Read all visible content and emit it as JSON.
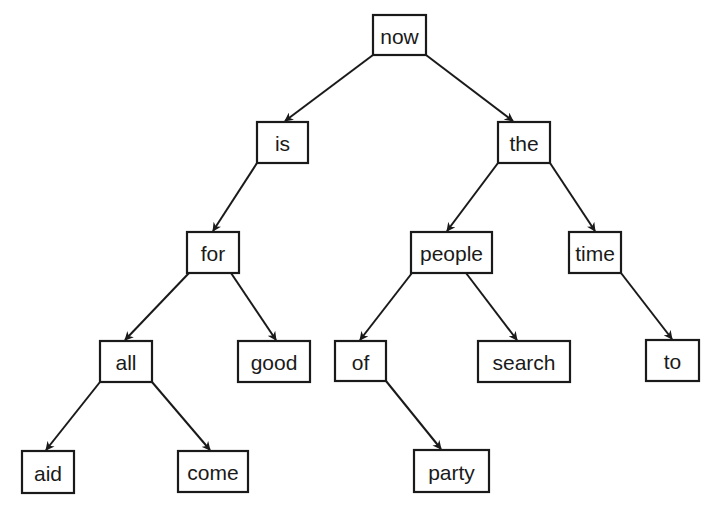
{
  "diagram": {
    "type": "binary-search-tree",
    "colors": {
      "stroke": "#1a1a1a",
      "background": "#ffffff",
      "node_fill": "#ffffff"
    },
    "nodes": [
      {
        "id": "now",
        "label": "now",
        "x": 373,
        "y": 15,
        "w": 53,
        "h": 40
      },
      {
        "id": "is",
        "label": "is",
        "x": 257,
        "y": 122,
        "w": 51,
        "h": 41
      },
      {
        "id": "the",
        "label": "the",
        "x": 498,
        "y": 122,
        "w": 52,
        "h": 41
      },
      {
        "id": "for",
        "label": "for",
        "x": 187,
        "y": 232,
        "w": 52,
        "h": 41
      },
      {
        "id": "people",
        "label": "people",
        "x": 411,
        "y": 232,
        "w": 81,
        "h": 41
      },
      {
        "id": "time",
        "label": "time",
        "x": 569,
        "y": 232,
        "w": 52,
        "h": 41
      },
      {
        "id": "all",
        "label": "all",
        "x": 100,
        "y": 341,
        "w": 52,
        "h": 41
      },
      {
        "id": "good",
        "label": "good",
        "x": 238,
        "y": 341,
        "w": 72,
        "h": 41
      },
      {
        "id": "of",
        "label": "of",
        "x": 335,
        "y": 341,
        "w": 51,
        "h": 40
      },
      {
        "id": "search",
        "label": "search",
        "x": 478,
        "y": 341,
        "w": 92,
        "h": 41
      },
      {
        "id": "to",
        "label": "to",
        "x": 646,
        "y": 340,
        "w": 53,
        "h": 41
      },
      {
        "id": "aid",
        "label": "aid",
        "x": 22,
        "y": 451,
        "w": 52,
        "h": 42
      },
      {
        "id": "come",
        "label": "come",
        "x": 178,
        "y": 451,
        "w": 70,
        "h": 41
      },
      {
        "id": "party",
        "label": "party",
        "x": 414,
        "y": 450,
        "w": 75,
        "h": 42
      }
    ],
    "edges": [
      {
        "from": "now",
        "to": "is",
        "x1": 373,
        "y1": 55,
        "x2": 285,
        "y2": 121
      },
      {
        "from": "now",
        "to": "the",
        "x1": 426,
        "y1": 55,
        "x2": 513,
        "y2": 121
      },
      {
        "from": "is",
        "to": "for",
        "x1": 257,
        "y1": 163,
        "x2": 213,
        "y2": 231
      },
      {
        "from": "the",
        "to": "people",
        "x1": 498,
        "y1": 163,
        "x2": 447,
        "y2": 231
      },
      {
        "from": "the",
        "to": "time",
        "x1": 550,
        "y1": 163,
        "x2": 595,
        "y2": 231
      },
      {
        "from": "for",
        "to": "all",
        "x1": 189,
        "y1": 273,
        "x2": 125,
        "y2": 340
      },
      {
        "from": "for",
        "to": "good",
        "x1": 231,
        "y1": 273,
        "x2": 276,
        "y2": 340
      },
      {
        "from": "people",
        "to": "of",
        "x1": 412,
        "y1": 273,
        "x2": 360,
        "y2": 340
      },
      {
        "from": "people",
        "to": "search",
        "x1": 466,
        "y1": 273,
        "x2": 517,
        "y2": 340
      },
      {
        "from": "time",
        "to": "to",
        "x1": 621,
        "y1": 273,
        "x2": 672,
        "y2": 339
      },
      {
        "from": "all",
        "to": "aid",
        "x1": 100,
        "y1": 382,
        "x2": 46,
        "y2": 450
      },
      {
        "from": "all",
        "to": "come",
        "x1": 152,
        "y1": 382,
        "x2": 210,
        "y2": 450
      },
      {
        "from": "of",
        "to": "party",
        "x1": 386,
        "y1": 381,
        "x2": 441,
        "y2": 449
      }
    ]
  }
}
